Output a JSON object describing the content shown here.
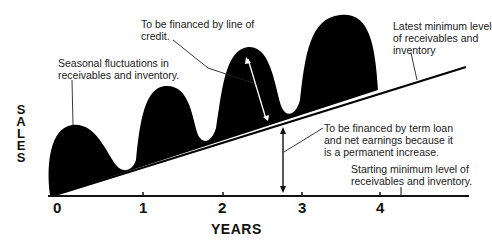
{
  "diagram": {
    "y_axis_label": "SALES",
    "y_axis_letters": [
      "S",
      "A",
      "L",
      "E",
      "S"
    ],
    "x_axis_label": "YEARS",
    "x_ticks": [
      "0",
      "1",
      "2",
      "3",
      "4"
    ],
    "annotations": {
      "line_of_credit": "To be financed by line of\ncredit.",
      "seasonal": "Seasonal fluctuations in\nreceivables and inventory.",
      "latest_minimum": "Latest minimum level\nof receivables and\ninventory",
      "term_loan": "To be financed by term loan\nand net earnings because it\nis a permanent increase.",
      "starting_minimum": "Starting minimum level of\nreceivables and inventory."
    },
    "colors": {
      "fill": "#000000",
      "line": "#111111",
      "background": "#ffffff"
    }
  }
}
